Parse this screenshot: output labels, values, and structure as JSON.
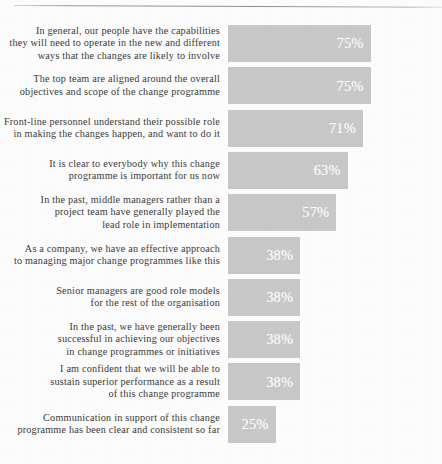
{
  "chart_data": {
    "type": "bar",
    "orientation": "horizontal",
    "title": "",
    "subtitle": "",
    "xlabel": "",
    "ylabel": "",
    "xlim": [
      0,
      100
    ],
    "grid": false,
    "legend": null,
    "value_suffix": "%",
    "bar_color": "#c9c9c9",
    "value_label_color": "#ffffff",
    "label_color": "#3a3a3a",
    "categories": [
      "In general, our people have the capabilities they will need to operate in the new and different ways that the changes are likely to involve",
      "The top team are aligned around the overall objectives and scope of the change programme",
      "Front-line personnel understand their possible role in making the changes happen, and want to do it",
      "It is clear to everybody why this change programme is important for us now",
      "In the past, middle managers rather than a project team have generally played the lead role in implementation",
      "As a company, we have an effective approach to managing major change programmes like this",
      "Senior managers are good role models for the rest of the organisation",
      "In the past, we have generally been successful in achieving our objectives in change programmes or initiatives",
      "I am confident that we will be able to sustain superior performance as a result of this change programme",
      "Communication in support of this change programme has been clear and consistent so far"
    ],
    "values": [
      75,
      75,
      71,
      63,
      57,
      38,
      38,
      38,
      38,
      25
    ],
    "value_labels": [
      "75%",
      "75%",
      "71%",
      "63%",
      "57%",
      "38%",
      "38%",
      "38%",
      "38%",
      "25%"
    ]
  },
  "rows": [
    {
      "lines": [
        "In general, our people have the capabilities",
        "they will need to operate in the new and different",
        "ways that the changes are likely to involve"
      ],
      "value_label": "75%"
    },
    {
      "lines": [
        "The top team are aligned around the overall",
        "objectives and scope of the change programme"
      ],
      "value_label": "75%"
    },
    {
      "lines": [
        "Front-line personnel understand their possible role",
        "in making the changes happen, and want to do it"
      ],
      "value_label": "71%"
    },
    {
      "lines": [
        "It is clear to everybody why this change",
        "programme is important for us now"
      ],
      "value_label": "63%"
    },
    {
      "lines": [
        "In the past, middle managers rather than a",
        "project team have generally played the",
        "lead role in implementation"
      ],
      "value_label": "57%"
    },
    {
      "lines": [
        "As a company, we have an effective approach",
        "to managing major change programmes like this"
      ],
      "value_label": "38%"
    },
    {
      "lines": [
        "Senior managers are good role models",
        "for the rest of the organisation"
      ],
      "value_label": "38%"
    },
    {
      "lines": [
        "In the past, we have generally been",
        "successful in achieving our objectives",
        "in change programmes or initiatives"
      ],
      "value_label": "38%"
    },
    {
      "lines": [
        "I am confident that we will be able to",
        "sustain superior performance as a result",
        "of this change programme"
      ],
      "value_label": "38%"
    },
    {
      "lines": [
        "Communication in support of this change",
        "programme has been clear and consistent so far"
      ],
      "value_label": "25%"
    }
  ]
}
